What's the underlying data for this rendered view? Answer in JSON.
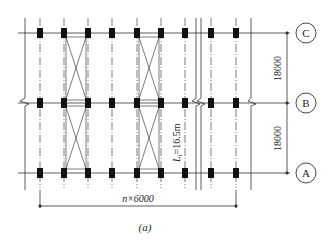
{
  "figure": {
    "caption": "(a)",
    "colors": {
      "line": "#333333",
      "column": "#111111",
      "background": "#ffffff"
    }
  },
  "axes": {
    "rows": [
      {
        "label": "C",
        "y": 33
      },
      {
        "label": "B",
        "y": 103
      },
      {
        "label": "A",
        "y": 173
      }
    ],
    "columns_x": [
      40,
      64,
      88,
      112,
      137,
      161,
      185,
      211,
      236
    ]
  },
  "dimensions": {
    "spacing_CB": "18000",
    "spacing_BA": "18000",
    "bay_total": "n×6000",
    "truss_length": "L",
    "truss_length_sub": "t",
    "truss_length_value": "=16.5m"
  },
  "bracing_bays": [
    {
      "from_col": 1,
      "to_col": 2
    },
    {
      "from_col": 4,
      "to_col": 5
    }
  ]
}
